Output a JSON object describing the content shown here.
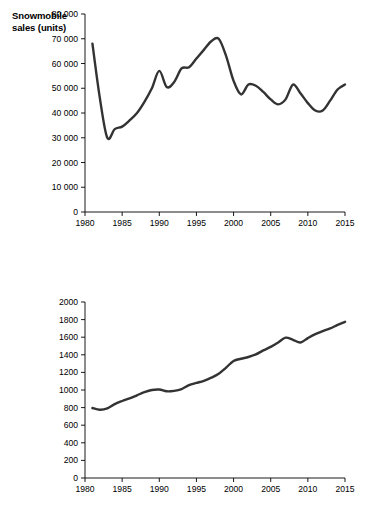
{
  "page": {
    "background": "#ffffff",
    "line_color": "#333333",
    "axis_color": "#000000"
  },
  "chart_data": [
    {
      "id": "snowmobile-sales",
      "type": "line",
      "title": "Snowmobile\nsales (units)",
      "title_lines": [
        "Snowmobile",
        "sales (units)"
      ],
      "xlabel": "",
      "ylabel": "Snowmobile sales (units)",
      "xlim": [
        1980,
        2015
      ],
      "ylim": [
        0,
        80000
      ],
      "grid": false,
      "legend": null,
      "xticks": [
        1980,
        1985,
        1990,
        1995,
        2000,
        2005,
        2010,
        2015
      ],
      "xticklabels": [
        "1980",
        "1985",
        "1990",
        "1995",
        "2000",
        "2005",
        "2010",
        "2015"
      ],
      "yticks": [
        0,
        10000,
        20000,
        30000,
        40000,
        50000,
        60000,
        70000,
        80000
      ],
      "yticklabels": [
        "0",
        "10 000",
        "20 000",
        "30 000",
        "40 000",
        "50 000",
        "60 000",
        "70 000",
        "80 000"
      ],
      "x": [
        1981,
        1982,
        1983,
        1984,
        1985,
        1986,
        1987,
        1988,
        1989,
        1990,
        1991,
        1992,
        1993,
        1994,
        1995,
        1996,
        1997,
        1998,
        1999,
        2000,
        2001,
        2002,
        2003,
        2004,
        2005,
        2006,
        2007,
        2008,
        2009,
        2010,
        2011,
        2012,
        2013,
        2014,
        2015
      ],
      "values": [
        68000,
        46000,
        30000,
        33500,
        34500,
        37000,
        40000,
        44500,
        50000,
        57000,
        50500,
        52500,
        58000,
        58500,
        62000,
        65500,
        69000,
        70000,
        63000,
        53000,
        47500,
        51500,
        51000,
        48500,
        45500,
        43500,
        45500,
        51500,
        48000,
        44000,
        41000,
        41000,
        45000,
        49500,
        51500
      ]
    },
    {
      "id": "real-gdp",
      "type": "line",
      "title": "Real GDP\n(billions of\n2007 dollars)",
      "title_lines": [
        "Real GDP",
        "(billions of",
        "2007 dollars)"
      ],
      "xlabel": "",
      "ylabel": "Real GDP (billions of 2007 dollars)",
      "xlim": [
        1980,
        2015
      ],
      "ylim": [
        0,
        2000
      ],
      "grid": false,
      "legend": null,
      "xticks": [
        1980,
        1985,
        1990,
        1995,
        2000,
        2005,
        2010,
        2015
      ],
      "xticklabels": [
        "1980",
        "1985",
        "1990",
        "1995",
        "2000",
        "2005",
        "2010",
        "2015"
      ],
      "yticks": [
        0,
        200,
        400,
        600,
        800,
        1000,
        1200,
        1400,
        1600,
        1800,
        2000
      ],
      "yticklabels": [
        "0",
        "200",
        "400",
        "600",
        "800",
        "1000",
        "1200",
        "1400",
        "1600",
        "1800",
        "2000"
      ],
      "x": [
        1981,
        1982,
        1983,
        1984,
        1985,
        1986,
        1987,
        1988,
        1989,
        1990,
        1991,
        1992,
        1993,
        1994,
        1995,
        1996,
        1997,
        1998,
        1999,
        2000,
        2001,
        2002,
        2003,
        2004,
        2005,
        2006,
        2007,
        2008,
        2009,
        2010,
        2011,
        2012,
        2013,
        2014,
        2015
      ],
      "values": [
        795,
        775,
        790,
        840,
        875,
        905,
        940,
        975,
        1000,
        1005,
        985,
        990,
        1010,
        1055,
        1080,
        1105,
        1140,
        1185,
        1255,
        1330,
        1355,
        1375,
        1405,
        1450,
        1490,
        1540,
        1595,
        1570,
        1540,
        1590,
        1635,
        1670,
        1700,
        1740,
        1775
      ]
    }
  ]
}
